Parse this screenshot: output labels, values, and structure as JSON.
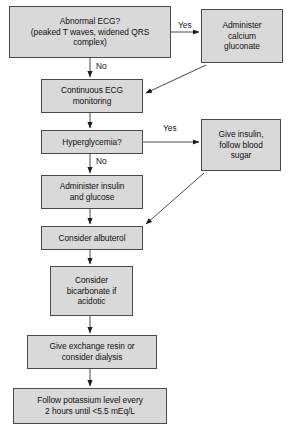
{
  "diagram": {
    "background_color": "#ffffff",
    "node_fill_color": "#d9d9d9",
    "node_border_color": "#4a4a4a",
    "text_color": "#111111",
    "nodes": [
      {
        "id": "abnormal-ecg",
        "label": "Abnormal ECG?\n(peaked T waves, widened QRS\ncomplex)",
        "x": 9,
        "y": 6,
        "w": 162,
        "h": 52
      },
      {
        "id": "calcium-gluconate",
        "label": "Administer\ncalcium\ngluconate",
        "x": 201,
        "y": 9,
        "w": 82,
        "h": 54
      },
      {
        "id": "continuous-ecg",
        "label": "Continuous ECG\nmonitoring",
        "x": 41,
        "y": 79,
        "w": 102,
        "h": 34
      },
      {
        "id": "hyperglycemia",
        "label": "Hyperglycemia?",
        "x": 41,
        "y": 130,
        "w": 102,
        "h": 24
      },
      {
        "id": "give-insulin-follow-sugar",
        "label": "Give insulin,\nfollow blood\nsugar",
        "x": 201,
        "y": 119,
        "w": 80,
        "h": 52
      },
      {
        "id": "administer-insulin-glucose",
        "label": "Administer insulin\nand glucose",
        "x": 41,
        "y": 175,
        "w": 102,
        "h": 34
      },
      {
        "id": "consider-albuterol",
        "label": "Consider albuterol",
        "x": 41,
        "y": 226,
        "w": 102,
        "h": 24
      },
      {
        "id": "consider-bicarbonate",
        "label": "Consider\nbicarbonate if\nacidotic",
        "x": 50,
        "y": 266,
        "w": 83,
        "h": 50
      },
      {
        "id": "exchange-resin-dialysis",
        "label": "Give exchange resin or\nconsider dialysis",
        "x": 27,
        "y": 335,
        "w": 130,
        "h": 34
      },
      {
        "id": "follow-potassium",
        "label": "Follow potassium level every\n2 hours until <5.5 mEq/L",
        "x": 13,
        "y": 388,
        "w": 154,
        "h": 36
      }
    ],
    "edge_labels": [
      {
        "id": "yes-ecg",
        "text": "Yes",
        "x": 178,
        "y": 21
      },
      {
        "id": "no-ecg",
        "text": "No",
        "x": 96,
        "y": 62
      },
      {
        "id": "yes-hyperglycemia",
        "text": "Yes",
        "x": 163,
        "y": 124
      },
      {
        "id": "no-hyperglycemia",
        "text": "No",
        "x": 96,
        "y": 157
      }
    ],
    "edges": [
      {
        "id": "abnormal-ecg-to-calcium",
        "from": "abnormal-ecg",
        "to": "calcium-gluconate",
        "kind": "elbow-right"
      },
      {
        "id": "abnormal-ecg-to-continuous",
        "from": "abnormal-ecg",
        "to": "continuous-ecg",
        "kind": "vertical"
      },
      {
        "id": "calcium-to-continuous",
        "from": "calcium-gluconate",
        "to": "continuous-ecg",
        "kind": "diagonal"
      },
      {
        "id": "continuous-to-hyperglycemia",
        "from": "continuous-ecg",
        "to": "hyperglycemia",
        "kind": "vertical"
      },
      {
        "id": "hyperglycemia-to-give-insulin",
        "from": "hyperglycemia",
        "to": "give-insulin-follow-sugar",
        "kind": "horizontal"
      },
      {
        "id": "hyperglycemia-to-administer-insulin",
        "from": "hyperglycemia",
        "to": "administer-insulin-glucose",
        "kind": "vertical"
      },
      {
        "id": "give-insulin-to-albuterol",
        "from": "give-insulin-follow-sugar",
        "to": "consider-albuterol",
        "kind": "diagonal"
      },
      {
        "id": "administer-insulin-to-albuterol",
        "from": "administer-insulin-glucose",
        "to": "consider-albuterol",
        "kind": "vertical"
      },
      {
        "id": "albuterol-to-bicarbonate",
        "from": "consider-albuterol",
        "to": "consider-bicarbonate",
        "kind": "vertical"
      },
      {
        "id": "bicarbonate-to-resin",
        "from": "consider-bicarbonate",
        "to": "exchange-resin-dialysis",
        "kind": "vertical"
      },
      {
        "id": "resin-to-follow-potassium",
        "from": "exchange-resin-dialysis",
        "to": "follow-potassium",
        "kind": "vertical"
      }
    ]
  }
}
